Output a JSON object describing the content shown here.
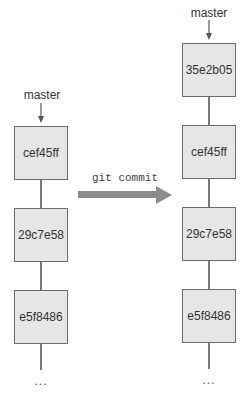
{
  "before": {
    "branch_label": "master",
    "commits": [
      "cef45ff",
      "29c7e58",
      "e5f8486"
    ],
    "ellipsis": "..."
  },
  "operation": {
    "command": "git commit",
    "arrow_color": "#8c8c8c"
  },
  "after": {
    "branch_label": "master",
    "commits": [
      "35e2b05",
      "cef45ff",
      "29c7e58",
      "e5f8486"
    ],
    "ellipsis": "..."
  }
}
